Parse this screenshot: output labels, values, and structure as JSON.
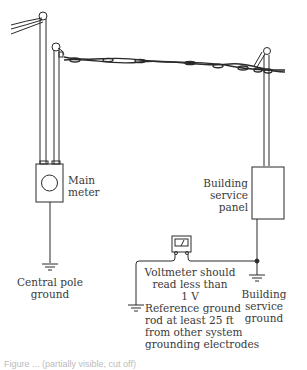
{
  "diagram": {
    "labels": {
      "main_meter": [
        "Main",
        "meter"
      ],
      "central_pole_ground": [
        "Central pole",
        "ground"
      ],
      "building_service_panel": [
        "Building",
        "service",
        "panel"
      ],
      "voltmeter_note": [
        "Voltmeter should",
        "read less than",
        "1 V"
      ],
      "building_service_ground": [
        "Building service",
        "ground"
      ],
      "reference_ground_rod": [
        "Reference ground",
        "rod at least 25 ft",
        "from other system",
        "grounding electrodes"
      ]
    },
    "caption": "Figure ... (partially visible, cut off)",
    "components": [
      "utility-pole-left",
      "utility-pole-right",
      "service-drop-cable",
      "main-meter",
      "building-service-panel",
      "voltmeter",
      "ground-symbols"
    ],
    "colors": {
      "line": "#2a2a2a",
      "text": "#3a3a3a",
      "background": "#ffffff"
    }
  }
}
